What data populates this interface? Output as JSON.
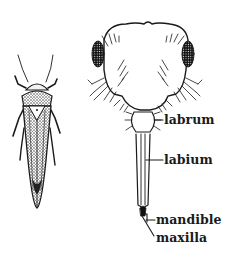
{
  "diagram": {
    "figures": [
      {
        "name": "leafhopper-dorsal-view"
      },
      {
        "name": "head-mouthparts-front-view"
      }
    ],
    "labels": [
      {
        "id": "labrum",
        "text": "labrum",
        "x": 164,
        "y": 118
      },
      {
        "id": "labium",
        "text": "labium",
        "x": 164,
        "y": 158
      },
      {
        "id": "mandible",
        "text": "mandible",
        "x": 148,
        "y": 219
      },
      {
        "id": "maxilla",
        "text": "maxilla",
        "x": 155,
        "y": 238
      }
    ],
    "colors": {
      "ink": "#1a1a1a",
      "background": "#ffffff"
    }
  }
}
